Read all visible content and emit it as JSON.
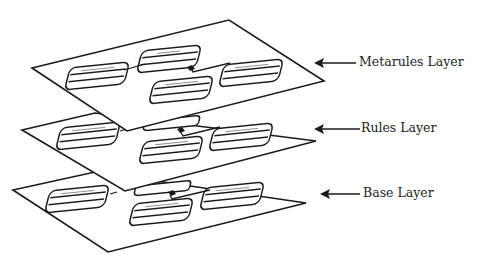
{
  "diagram": {
    "type": "stacked-layers",
    "colors": {
      "stroke": "#1a1a1a",
      "background": "#ffffff",
      "text": "#222222"
    },
    "layers": [
      {
        "id": "metarules",
        "label": "Metarules Layer",
        "entity_boxes": 4,
        "box_labels_legible": false
      },
      {
        "id": "rules",
        "label": "Rules Layer",
        "entity_boxes": 4,
        "box_labels_legible": false
      },
      {
        "id": "base",
        "label": "Base Layer",
        "entity_boxes": 4,
        "box_labels_legible": false
      }
    ],
    "arrow_icon": "left-arrow-icon"
  }
}
